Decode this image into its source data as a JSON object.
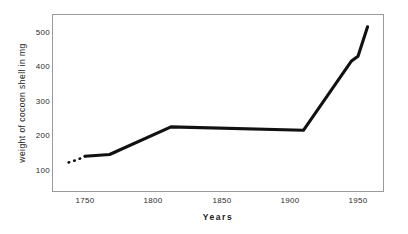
{
  "chart_data": {
    "type": "line",
    "title": "",
    "xlabel": "Years",
    "ylabel": "weight of cocoon shell in mg",
    "xlim": [
      1735,
      1960
    ],
    "ylim": [
      60,
      545
    ],
    "grid": false,
    "legend": null,
    "x_ticks": [
      1750,
      1800,
      1850,
      1900,
      1950
    ],
    "x_tick_labels": [
      "1750",
      "1800",
      "1850",
      "1900",
      "1950"
    ],
    "y_ticks": [
      100,
      200,
      300,
      400,
      500
    ],
    "y_tick_labels": [
      "100",
      "200",
      "300",
      "400",
      "500"
    ],
    "series": [
      {
        "name": "weight of cocoon shell",
        "style": "dotted",
        "note": "extrapolated early segment",
        "x": [
          1738,
          1743,
          1747,
          1750
        ],
        "values": [
          122,
          128,
          134,
          140
        ]
      },
      {
        "name": "weight of cocoon shell",
        "style": "solid",
        "x": [
          1750,
          1768,
          1813,
          1910,
          1945,
          1950,
          1957
        ],
        "values": [
          140,
          145,
          225,
          215,
          415,
          430,
          515
        ]
      }
    ],
    "line_color": "#111111",
    "frame_color": "#9a9a9a",
    "background_color": "#ffffff"
  },
  "axes": {
    "y_title": "weight of cocoon shell in mg",
    "x_title": "Years",
    "y_tick_0": "100",
    "y_tick_1": "200",
    "y_tick_2": "300",
    "y_tick_3": "400",
    "y_tick_4": "500",
    "x_tick_0": "1750",
    "x_tick_1": "1800",
    "x_tick_2": "1850",
    "x_tick_3": "1900",
    "x_tick_4": "1950"
  }
}
